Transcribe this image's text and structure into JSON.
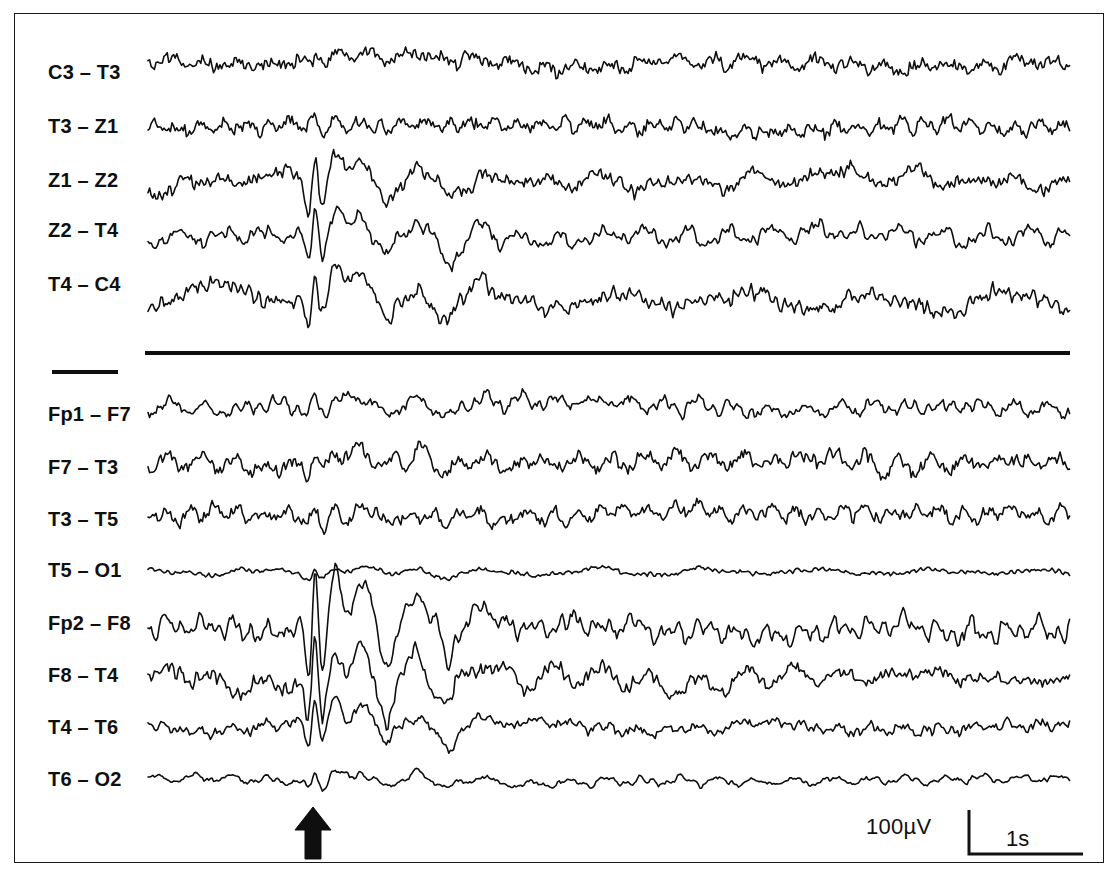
{
  "figure": {
    "type": "eeg-recording",
    "background_color": "#ffffff",
    "trace_color": "#100f0f",
    "frame_color": "#1a1a1a"
  },
  "montage_groups": [
    {
      "name": "transverse-chain",
      "channels": [
        {
          "label": "C3 – T3",
          "baseline_y": 63,
          "amplitude": 9,
          "roughness": 1.0,
          "spike": 0.25
        },
        {
          "label": "T3 – Z1",
          "baseline_y": 127,
          "amplitude": 9,
          "roughness": 0.95,
          "spike": 0.35
        },
        {
          "label": "Z1 – Z2",
          "baseline_y": 186,
          "amplitude": 13,
          "roughness": 0.55,
          "spike": 1.55
        },
        {
          "label": "Z2 – T4",
          "baseline_y": 239,
          "amplitude": 11,
          "roughness": 0.55,
          "spike": 1.75
        },
        {
          "label": "T4 – C4",
          "baseline_y": 300,
          "amplitude": 13,
          "roughness": 0.7,
          "spike": 1.35
        }
      ]
    },
    {
      "name": "double-banana-chain",
      "channels": [
        {
          "label": "Fp1 – F7",
          "baseline_y": 408,
          "amplitude": 8,
          "roughness": 0.7,
          "spike": 0.95
        },
        {
          "label": "F7 – T3",
          "baseline_y": 462,
          "amplitude": 10,
          "roughness": 1.0,
          "spike": 0.7
        },
        {
          "label": "T3 – T5",
          "baseline_y": 515,
          "amplitude": 9,
          "roughness": 0.95,
          "spike": 0.55
        },
        {
          "label": "T5 – O1",
          "baseline_y": 572,
          "amplitude": 4,
          "roughness": 0.6,
          "spike": 0.85
        },
        {
          "label": "Fp2 – F8",
          "baseline_y": 628,
          "amplitude": 15,
          "roughness": 0.45,
          "spike": 2.3
        },
        {
          "label": "F8 – T4",
          "baseline_y": 676,
          "amplitude": 13,
          "roughness": 0.55,
          "spike": 2.1
        },
        {
          "label": "T4 – T6",
          "baseline_y": 726,
          "amplitude": 10,
          "roughness": 0.6,
          "spike": 1.6
        },
        {
          "label": "T6 – O2",
          "baseline_y": 780,
          "amplitude": 5,
          "roughness": 0.5,
          "spike": 1.3
        }
      ]
    }
  ],
  "label_positions": {
    "C3 – T3": 76,
    "T3 – Z1": 130,
    "Z1 – Z2": 184,
    "Z2 – T4": 234,
    "T4 – C4": 288,
    "Fp1 – F7": 418,
    "F7 – T3": 471,
    "T3 – T5": 523,
    "T5 – O1": 574,
    "Fp2 – F8": 627,
    "F8 – T4": 679,
    "T4 – T6": 731,
    "T6 – O2": 783
  },
  "trace_area": {
    "x_start": 148,
    "x_end": 1070,
    "sample_step": 1.6
  },
  "event_marker": {
    "name": "epileptiform-discharge-arrow",
    "x_center": 313,
    "direction": "up"
  },
  "calibration": {
    "amplitude_label": "100µV",
    "time_label": "1s",
    "amplitude_value": 100,
    "amplitude_unit": "µV",
    "time_value": 1,
    "time_unit": "s"
  }
}
